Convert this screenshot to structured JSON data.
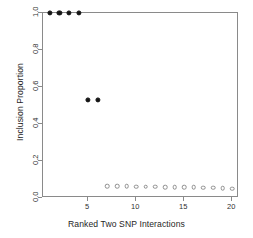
{
  "chart_data": {
    "type": "scatter",
    "title": "",
    "xlabel": "Ranked Two SNP Interactions",
    "ylabel": "Inclusion Proportion",
    "xlim": [
      0.3,
      20.7
    ],
    "ylim": [
      0.0,
      1.0
    ],
    "grid": false,
    "legend": null,
    "xticks": [
      5,
      10,
      15,
      20
    ],
    "xticklabels": [
      "5",
      "10",
      "15",
      "20"
    ],
    "yticks": [
      0.0,
      0.2,
      0.4,
      0.6,
      0.8,
      1.0
    ],
    "yticklabels": [
      "0.0",
      "0.2",
      "0.4",
      "0.6",
      "0.8",
      "1.0"
    ],
    "x": [
      1,
      2,
      3,
      4,
      5,
      6,
      7,
      8,
      9,
      10,
      11,
      12,
      13,
      14,
      15,
      16,
      17,
      18,
      19,
      20
    ],
    "y": [
      1.0,
      1.0,
      1.0,
      1.0,
      0.53,
      0.53,
      0.065,
      0.063,
      0.063,
      0.06,
      0.06,
      0.06,
      0.059,
      0.058,
      0.058,
      0.057,
      0.056,
      0.055,
      0.053,
      0.05
    ],
    "marker_styles": [
      "filled",
      "filled",
      "filled",
      "filled",
      "filled",
      "filled",
      "open",
      "open",
      "open",
      "open",
      "open",
      "open",
      "open",
      "open",
      "open",
      "open",
      "open",
      "open",
      "open",
      "open"
    ],
    "series": [
      {
        "name": "Inclusion Proportion",
        "marker_filled_color": "#141414",
        "marker_open_color": "#8e8e8e",
        "values": [
          1.0,
          1.0,
          1.0,
          1.0,
          0.53,
          0.53,
          0.065,
          0.063,
          0.063,
          0.06,
          0.06,
          0.06,
          0.059,
          0.058,
          0.058,
          0.057,
          0.056,
          0.055,
          0.053,
          0.05
        ]
      }
    ],
    "frame_color": "#8a8a8a",
    "background_color": "#ffffff"
  }
}
